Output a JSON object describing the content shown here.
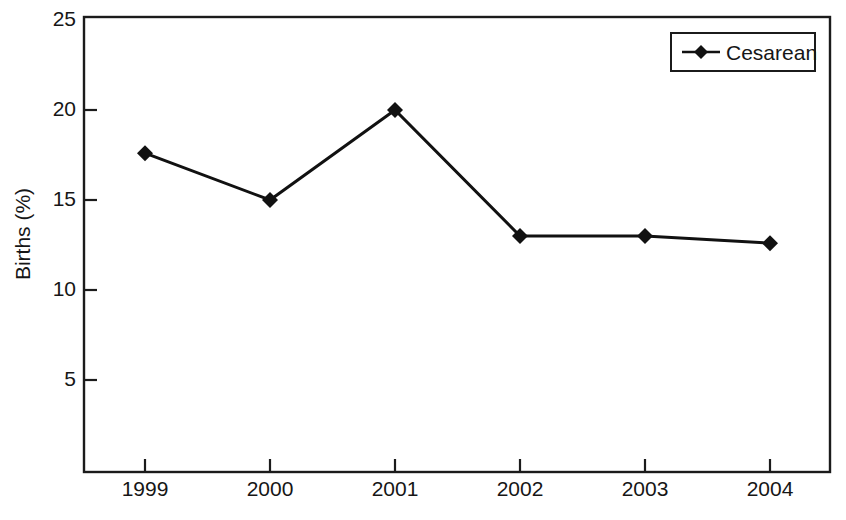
{
  "chart_data": {
    "type": "line",
    "title": "",
    "xlabel": "",
    "ylabel": "Births (%)",
    "categories": [
      "1999",
      "2000",
      "2001",
      "2002",
      "2003",
      "2004"
    ],
    "x": [
      1999,
      2000,
      2001,
      2002,
      2003,
      2004
    ],
    "series": [
      {
        "name": "Cesarean",
        "values": [
          17.6,
          15.0,
          20.0,
          13.0,
          13.0,
          12.6
        ],
        "marker": "diamond",
        "color": "#111111"
      }
    ],
    "ylim": [
      0.9,
      25
    ],
    "yticks": [
      5,
      10,
      15,
      20,
      25
    ],
    "ytick_labels": [
      "5",
      "10",
      "15",
      "20",
      "25"
    ],
    "xtick_labels": [
      "1999",
      "2000",
      "2001",
      "2002",
      "2003",
      "2004"
    ],
    "grid": false,
    "legend_position": "top-right",
    "legend_entries": [
      "Cesarean"
    ],
    "frame": true,
    "tick_direction": "in"
  },
  "axes": {
    "y_title": "Births (%)",
    "y_tick_labels": [
      "25",
      "20",
      "15",
      "10",
      "5"
    ],
    "x_tick_labels": [
      "1999",
      "2000",
      "2001",
      "2002",
      "2003",
      "2004"
    ]
  },
  "legend": {
    "items": [
      {
        "label": "Cesarean"
      }
    ]
  },
  "colors": {
    "line": "#111111",
    "marker": "#111111",
    "frame": "#1b1b1b",
    "text": "#161616",
    "background": "#ffffff"
  }
}
